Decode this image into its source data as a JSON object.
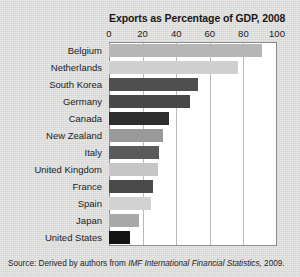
{
  "chart_data": {
    "type": "bar",
    "orientation": "horizontal",
    "title": "Exports as Percentage of GDP, 2008",
    "xlabel": "",
    "ylabel": "",
    "xlim": [
      0,
      100
    ],
    "xticks": [
      0,
      20,
      40,
      60,
      80,
      100
    ],
    "xtick_labels": [
      "0",
      "20",
      "40",
      "60",
      "80",
      "100"
    ],
    "grid": true,
    "grid_axis": "x",
    "legend": "none",
    "categories": [
      "Belgium",
      "Netherlands",
      "South Korea",
      "Germany",
      "Canada",
      "New Zealand",
      "Italy",
      "United Kingdom",
      "France",
      "Spain",
      "Japan",
      "United States"
    ],
    "values": [
      91,
      77,
      53,
      48,
      36,
      32,
      30,
      29,
      26,
      25,
      18,
      12.5
    ],
    "bar_colors": [
      "#b6b6b6",
      "#cfcfcf",
      "#4f4f4f",
      "#484848",
      "#2e2e2e",
      "#9a9a9a",
      "#5a5a5a",
      "#c6c6c6",
      "#494949",
      "#d2d2d2",
      "#a9a9a9",
      "#131313"
    ]
  },
  "source": {
    "label": "Source:",
    "text_before": "Derived by authors from",
    "italic": "IMF International Financial Statistics,",
    "text_after": "2009.",
    "full": "Source:  Derived by authors from IMF International Financial Statistics, 2009."
  },
  "colors": {
    "page_background": "#dcdcda",
    "plot_background": "#ffffff",
    "plot_border": "#8d8d8d",
    "gridline": "#b9b9b9",
    "text": "#1c1c1c"
  }
}
